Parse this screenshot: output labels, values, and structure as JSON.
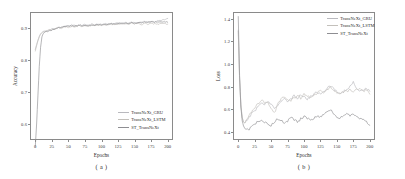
{
  "figure": {
    "panels": [
      {
        "caption": "( a )",
        "xlabel": "Epochs",
        "ylabel": "Accuracy",
        "xticks": [
          "0",
          "25",
          "50",
          "75",
          "100",
          "125",
          "150",
          "175",
          "200"
        ],
        "yticks": [
          "0.6",
          "0.7",
          "0.8",
          "0.9"
        ],
        "legend_position": "lower right",
        "legend": [
          {
            "label": "TransNeXt_GRU",
            "color": "#b9b9be"
          },
          {
            "label": "TransNeXt_LSTM",
            "color": "#c3c0bb"
          },
          {
            "label": "ST_TransNeXt",
            "color": "#8e8e92"
          }
        ]
      },
      {
        "caption": "( b )",
        "xlabel": "Epochs",
        "ylabel": "Loss",
        "xticks": [
          "0",
          "25",
          "50",
          "75",
          "100",
          "125",
          "150",
          "175",
          "200"
        ],
        "yticks": [
          "0.4",
          "0.6",
          "0.8",
          "1.0",
          "1.2",
          "1.4"
        ],
        "legend_position": "upper right",
        "legend": [
          {
            "label": "TransNeXt_GRU",
            "color": "#b9b9be"
          },
          {
            "label": "TransNeXt_LSTM",
            "color": "#c3c0bb"
          },
          {
            "label": "ST_TransNeXt",
            "color": "#8e8e92"
          }
        ]
      }
    ]
  },
  "chart_data": [
    {
      "type": "line",
      "title": "",
      "xlabel": "Epochs",
      "ylabel": "Accuracy",
      "xlim": [
        -8,
        208
      ],
      "ylim": [
        0.55,
        0.95
      ],
      "grid": false,
      "legend_position": "lower right",
      "x": [
        0,
        2,
        4,
        6,
        8,
        10,
        12,
        15,
        20,
        25,
        30,
        35,
        40,
        45,
        50,
        55,
        60,
        65,
        70,
        75,
        80,
        85,
        90,
        95,
        100,
        105,
        110,
        115,
        120,
        125,
        130,
        135,
        140,
        145,
        150,
        155,
        160,
        165,
        170,
        175,
        180,
        185,
        190,
        195,
        200
      ],
      "series": [
        {
          "name": "TransNeXt_GRU",
          "color": "#b9b9be",
          "values": [
            0.833,
            0.848,
            0.862,
            0.874,
            0.882,
            0.886,
            0.889,
            0.891,
            0.894,
            0.897,
            0.899,
            0.901,
            0.903,
            0.905,
            0.906,
            0.909,
            0.907,
            0.91,
            0.908,
            0.911,
            0.909,
            0.912,
            0.91,
            0.913,
            0.911,
            0.914,
            0.912,
            0.915,
            0.913,
            0.916,
            0.914,
            0.917,
            0.915,
            0.918,
            0.916,
            0.919,
            0.917,
            0.92,
            0.918,
            0.921,
            0.919,
            0.922,
            0.923,
            0.927,
            0.93
          ]
        },
        {
          "name": "TransNeXt_LSTM",
          "color": "#c3c0bb",
          "values": [
            0.828,
            0.845,
            0.86,
            0.872,
            0.88,
            0.885,
            0.888,
            0.89,
            0.893,
            0.896,
            0.898,
            0.901,
            0.9,
            0.904,
            0.902,
            0.906,
            0.904,
            0.907,
            0.905,
            0.908,
            0.906,
            0.909,
            0.907,
            0.91,
            0.908,
            0.911,
            0.909,
            0.912,
            0.91,
            0.913,
            0.911,
            0.914,
            0.912,
            0.915,
            0.913,
            0.916,
            0.911,
            0.914,
            0.912,
            0.915,
            0.913,
            0.912,
            0.914,
            0.913,
            0.912
          ]
        },
        {
          "name": "ST_TransNeXt",
          "color": "#8e8e92",
          "values": [
            0.53,
            0.6,
            0.69,
            0.78,
            0.84,
            0.872,
            0.884,
            0.888,
            0.891,
            0.894,
            0.897,
            0.9,
            0.902,
            0.904,
            0.905,
            0.907,
            0.906,
            0.908,
            0.907,
            0.909,
            0.908,
            0.91,
            0.909,
            0.911,
            0.91,
            0.912,
            0.911,
            0.913,
            0.912,
            0.914,
            0.913,
            0.915,
            0.914,
            0.916,
            0.915,
            0.917,
            0.916,
            0.918,
            0.917,
            0.919,
            0.918,
            0.919,
            0.918,
            0.919,
            0.918
          ]
        }
      ]
    },
    {
      "type": "line",
      "title": "",
      "xlabel": "Epochs",
      "ylabel": "Loss",
      "xlim": [
        -8,
        208
      ],
      "ylim": [
        0.33,
        1.46
      ],
      "grid": false,
      "legend_position": "upper right",
      "x": [
        0,
        2,
        4,
        6,
        8,
        10,
        12,
        15,
        20,
        25,
        30,
        35,
        40,
        45,
        50,
        55,
        60,
        65,
        70,
        75,
        80,
        85,
        90,
        95,
        100,
        105,
        110,
        115,
        120,
        125,
        130,
        135,
        140,
        145,
        150,
        155,
        160,
        165,
        170,
        175,
        180,
        185,
        190,
        195,
        200
      ],
      "series": [
        {
          "name": "TransNeXt_GRU",
          "color": "#b9b9be",
          "values": [
            1.3,
            0.88,
            0.64,
            0.53,
            0.49,
            0.48,
            0.495,
            0.52,
            0.56,
            0.59,
            0.62,
            0.66,
            0.645,
            0.665,
            0.65,
            0.6,
            0.63,
            0.68,
            0.7,
            0.66,
            0.69,
            0.72,
            0.7,
            0.735,
            0.71,
            0.69,
            0.715,
            0.735,
            0.75,
            0.745,
            0.76,
            0.79,
            0.81,
            0.78,
            0.755,
            0.745,
            0.76,
            0.775,
            0.8,
            0.84,
            0.79,
            0.755,
            0.77,
            0.79,
            0.76
          ]
        },
        {
          "name": "TransNeXt_LSTM",
          "color": "#c3c0bb",
          "values": [
            1.29,
            0.87,
            0.63,
            0.525,
            0.488,
            0.478,
            0.5,
            0.53,
            0.575,
            0.61,
            0.65,
            0.68,
            0.66,
            0.655,
            0.6,
            0.565,
            0.645,
            0.69,
            0.71,
            0.69,
            0.67,
            0.705,
            0.72,
            0.7,
            0.735,
            0.72,
            0.7,
            0.725,
            0.745,
            0.76,
            0.745,
            0.77,
            0.8,
            0.775,
            0.745,
            0.74,
            0.755,
            0.76,
            0.775,
            0.76,
            0.77,
            0.785,
            0.76,
            0.78,
            0.735
          ]
        },
        {
          "name": "ST_TransNeXt",
          "color": "#8e8e92",
          "values": [
            1.42,
            0.9,
            0.62,
            0.5,
            0.455,
            0.43,
            0.425,
            0.42,
            0.445,
            0.47,
            0.49,
            0.505,
            0.49,
            0.47,
            0.455,
            0.49,
            0.52,
            0.505,
            0.48,
            0.5,
            0.53,
            0.51,
            0.49,
            0.515,
            0.54,
            0.52,
            0.5,
            0.525,
            0.545,
            0.53,
            0.555,
            0.575,
            0.6,
            0.565,
            0.535,
            0.52,
            0.545,
            0.56,
            0.54,
            0.555,
            0.535,
            0.52,
            0.505,
            0.49,
            0.46
          ]
        }
      ]
    }
  ]
}
